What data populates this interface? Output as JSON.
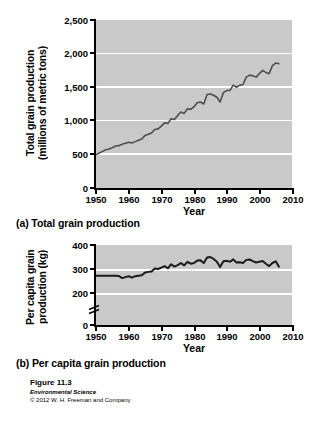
{
  "figure": {
    "number": "Figure 11.3",
    "book": "Environmental Science",
    "copyright": "© 2012 W. H. Freeman and Company"
  },
  "panels": {
    "a": {
      "caption": "(a) Total grain production"
    },
    "b": {
      "caption": "(b) Per capita grain production"
    }
  },
  "chart_data": [
    {
      "id": "total-grain-production",
      "type": "line",
      "title": "(a) Total grain production",
      "xlabel": "Year",
      "ylabel": "Total grain production\n(millions of metric tons)",
      "xlim": [
        1950,
        2010
      ],
      "ylim": [
        0,
        2500
      ],
      "xticks": [
        1950,
        1960,
        1970,
        1980,
        1990,
        2000,
        2010
      ],
      "xtick_labels": [
        "1950",
        "1960",
        "1970",
        "1980",
        "1990",
        "2000",
        "2010"
      ],
      "yticks": [
        0,
        500,
        1000,
        1500,
        2000,
        2500
      ],
      "ytick_labels": [
        "0",
        "500",
        "1,000",
        "1,500",
        "2,000",
        "2,500"
      ],
      "grid": "horizontal-white",
      "axis_break": false,
      "legend": "none",
      "plot_bg": "#c9c9c9",
      "line_color": "#4d4d4d",
      "x": [
        1950,
        1951,
        1952,
        1953,
        1954,
        1955,
        1956,
        1957,
        1958,
        1959,
        1960,
        1961,
        1962,
        1963,
        1964,
        1965,
        1966,
        1967,
        1968,
        1969,
        1970,
        1971,
        1972,
        1973,
        1974,
        1975,
        1976,
        1977,
        1978,
        1979,
        1980,
        1981,
        1982,
        1983,
        1984,
        1985,
        1986,
        1987,
        1988,
        1989,
        1990,
        1991,
        1992,
        1993,
        1994,
        1995,
        1996,
        1997,
        1998,
        1999,
        2000,
        2001,
        2002,
        2003,
        2004,
        2005,
        2006
      ],
      "y": [
        497,
        520,
        545,
        570,
        580,
        600,
        625,
        630,
        650,
        665,
        680,
        670,
        690,
        710,
        730,
        780,
        800,
        820,
        870,
        880,
        920,
        970,
        960,
        1030,
        1020,
        1080,
        1130,
        1110,
        1180,
        1170,
        1210,
        1270,
        1280,
        1250,
        1390,
        1400,
        1380,
        1350,
        1280,
        1420,
        1450,
        1450,
        1530,
        1500,
        1530,
        1540,
        1650,
        1680,
        1670,
        1650,
        1700,
        1750,
        1720,
        1700,
        1820,
        1860,
        1850
      ]
    },
    {
      "id": "per-capita-grain-production",
      "type": "line",
      "title": "(b) Per capita grain production",
      "xlabel": "Year",
      "ylabel": "Per capita grain\nproduction (kg)",
      "xlim": [
        1950,
        2010
      ],
      "ylim": [
        200,
        400
      ],
      "yaxis_zero_shown": true,
      "xticks": [
        1950,
        1960,
        1970,
        1980,
        1990,
        2000,
        2010
      ],
      "xtick_labels": [
        "1950",
        "1960",
        "1970",
        "1980",
        "1990",
        "2000",
        "2010"
      ],
      "yticks": [
        0,
        200,
        300,
        400
      ],
      "ytick_labels": [
        "0",
        "200",
        "300",
        "400"
      ],
      "grid": "horizontal-white",
      "axis_break": true,
      "axis_break_between": [
        0,
        200
      ],
      "legend": "none",
      "plot_bg": "#c9c9c9",
      "line_color": "#1a1a1a",
      "x": [
        1950,
        1951,
        1952,
        1953,
        1954,
        1955,
        1956,
        1957,
        1958,
        1959,
        1960,
        1961,
        1962,
        1963,
        1964,
        1965,
        1966,
        1967,
        1968,
        1969,
        1970,
        1971,
        1972,
        1973,
        1974,
        1975,
        1976,
        1977,
        1978,
        1979,
        1980,
        1981,
        1982,
        1983,
        1984,
        1985,
        1986,
        1987,
        1988,
        1989,
        1990,
        1991,
        1992,
        1993,
        1994,
        1995,
        1996,
        1997,
        1998,
        1999,
        2000,
        2001,
        2002,
        2003,
        2004,
        2005,
        2006
      ],
      "y": [
        272,
        272,
        272,
        272,
        272,
        272,
        272,
        271,
        262,
        266,
        270,
        264,
        270,
        272,
        274,
        285,
        288,
        290,
        302,
        300,
        306,
        312,
        303,
        320,
        310,
        316,
        325,
        315,
        330,
        322,
        325,
        335,
        336,
        325,
        348,
        350,
        342,
        330,
        308,
        332,
        334,
        330,
        340,
        327,
        328,
        325,
        338,
        340,
        333,
        327,
        330,
        333,
        322,
        312,
        325,
        332,
        310
      ]
    }
  ]
}
